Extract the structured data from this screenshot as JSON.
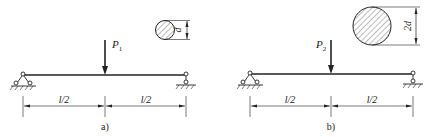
{
  "panels": [
    {
      "id": "a",
      "caption": "a)",
      "load_label": "P",
      "load_subscript": "1",
      "section_label": "d",
      "span_labels": [
        "l/2",
        "l/2"
      ]
    },
    {
      "id": "b",
      "caption": "b)",
      "load_label": "P",
      "load_subscript": "2",
      "section_label": "2d",
      "span_labels": [
        "l/2",
        "l/2"
      ]
    }
  ],
  "colors": {
    "line": "#222222",
    "hatch": "#555555",
    "background": "#ffffff"
  }
}
